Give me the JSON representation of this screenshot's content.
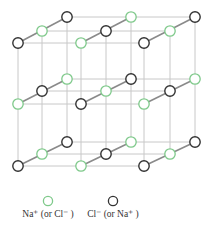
{
  "diagram": {
    "colors": {
      "ion_a": "#7ec98a",
      "ion_b": "#333333",
      "ion_fill": "#ffffff",
      "grid_line": "#c8c8c8",
      "bond_line": "#8a8a8a"
    },
    "layers_y": {
      "top": 0,
      "middle": 1,
      "bottom": 2
    },
    "legend": [
      {
        "symbol": "green-circle",
        "label": "Na⁺ (or Cl⁻ )"
      },
      {
        "symbol": "black-circle",
        "label": "Cl⁻ (or Na⁺ )"
      }
    ]
  }
}
